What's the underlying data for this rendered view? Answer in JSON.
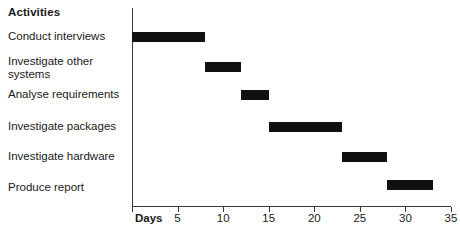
{
  "header": {
    "activities_label": "Activities"
  },
  "axis": {
    "days_label": "Days",
    "tick_labels": [
      "5",
      "10",
      "15",
      "20",
      "25",
      "30",
      "35"
    ]
  },
  "chart_data": {
    "type": "bar",
    "title": "",
    "xlabel": "Days",
    "ylabel": "Activities",
    "orientation": "horizontal",
    "subtype": "gantt",
    "grid": false,
    "legend": "none",
    "xlim": [
      0,
      35
    ],
    "xticks": [
      0,
      5,
      10,
      15,
      20,
      25,
      30,
      35
    ],
    "bar_color": "#111111",
    "categories": [
      "Conduct interviews",
      "Investigate other systems",
      "Analyse requirements",
      "Investigate packages",
      "Investigate hardware",
      "Produce report"
    ],
    "tasks": [
      {
        "name": "Conduct interviews",
        "start": 0,
        "end": 8,
        "duration": 8
      },
      {
        "name": "Investigate other systems",
        "start": 8,
        "end": 12,
        "duration": 4
      },
      {
        "name": "Analyse requirements",
        "start": 12,
        "end": 15,
        "duration": 3
      },
      {
        "name": "Investigate packages",
        "start": 15,
        "end": 23,
        "duration": 8
      },
      {
        "name": "Investigate hardware",
        "start": 23,
        "end": 28,
        "duration": 5
      },
      {
        "name": "Produce report",
        "start": 28,
        "end": 33,
        "duration": 5
      }
    ]
  },
  "rows": [
    {
      "label": "Conduct interviews",
      "label_top": 30,
      "bar_top": 32
    },
    {
      "label": "Investigate other systems",
      "label_top": 55,
      "bar_top": 62
    },
    {
      "label": "Analyse requirements",
      "label_top": 88,
      "bar_top": 90
    },
    {
      "label": "Investigate packages",
      "label_top": 120,
      "bar_top": 122
    },
    {
      "label": "Investigate hardware",
      "label_top": 150,
      "bar_top": 152
    },
    {
      "label": "Produce report",
      "label_top": 181,
      "bar_top": 180
    }
  ]
}
